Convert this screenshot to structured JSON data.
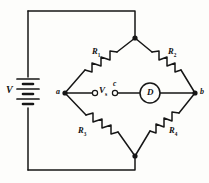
{
  "figure": {
    "type": "wheatstone-bridge-circuit",
    "stroke_color": "#161616",
    "background_color": "#fdfdfb"
  },
  "source": {
    "label": "V",
    "symbol": "battery-multicell",
    "cells": 3
  },
  "nodes": {
    "left": "a",
    "right": "b",
    "center_tap": "c",
    "top": "",
    "bottom": ""
  },
  "bridge_arm": {
    "voltage_label": "V",
    "voltage_subscript": "s",
    "terminal_left": "open-terminal",
    "terminal_right": "open-terminal"
  },
  "detector": {
    "label": "D",
    "shape": "circle"
  },
  "resistors": [
    {
      "label": "R",
      "subscript": "1",
      "position": "upper-left"
    },
    {
      "label": "R",
      "subscript": "2",
      "position": "upper-right"
    },
    {
      "label": "R",
      "subscript": "3",
      "position": "lower-left"
    },
    {
      "label": "R",
      "subscript": "4",
      "position": "lower-right"
    }
  ]
}
